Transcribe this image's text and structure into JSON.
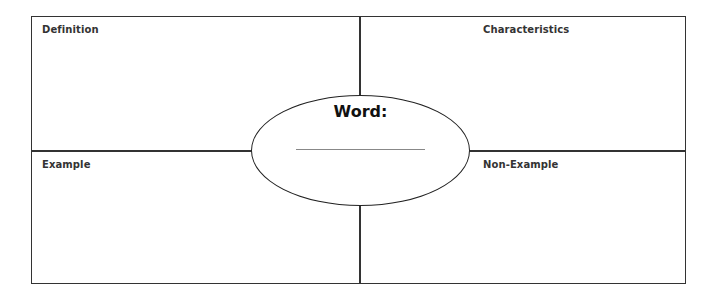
{
  "organizer": {
    "quadrants": {
      "top_left": "Definition",
      "top_right": "Characteristics",
      "bottom_left": "Example",
      "bottom_right": "Non-Example"
    },
    "center": {
      "label": "Word:",
      "answer_value": ""
    }
  }
}
